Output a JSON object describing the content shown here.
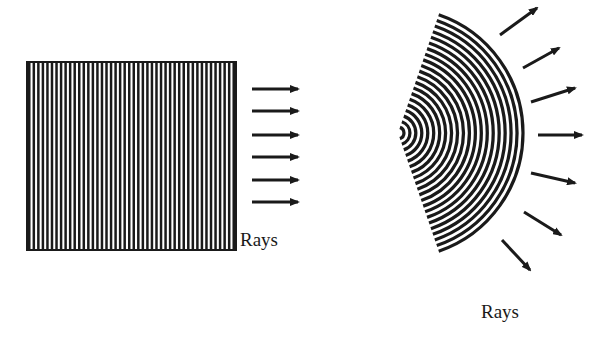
{
  "diagram": {
    "ink_color": "#1a1a1a",
    "background": "#ffffff",
    "plane_wave": {
      "label": "Rays",
      "box": {
        "x": 27,
        "y": 62,
        "width": 209,
        "height": 188
      },
      "stripe_count": 46,
      "arrows": [
        {
          "x1": 252,
          "y1": 89,
          "x2": 298,
          "y2": 89
        },
        {
          "x1": 252,
          "y1": 111,
          "x2": 298,
          "y2": 111
        },
        {
          "x1": 252,
          "y1": 135,
          "x2": 298,
          "y2": 135
        },
        {
          "x1": 252,
          "y1": 157,
          "x2": 298,
          "y2": 157
        },
        {
          "x1": 252,
          "y1": 180,
          "x2": 298,
          "y2": 180
        },
        {
          "x1": 252,
          "y1": 202,
          "x2": 298,
          "y2": 202
        }
      ]
    },
    "spherical_wave": {
      "label": "Rays",
      "vertex": {
        "x": 398,
        "y": 133
      },
      "outer_radius": 125,
      "half_angle_deg": 71,
      "ring_count": 21,
      "arrows": [
        {
          "x1": 500,
          "y1": 35,
          "x2": 537,
          "y2": 8
        },
        {
          "x1": 523,
          "y1": 68,
          "x2": 559,
          "y2": 48
        },
        {
          "x1": 531,
          "y1": 102,
          "x2": 575,
          "y2": 88
        },
        {
          "x1": 538,
          "y1": 135,
          "x2": 582,
          "y2": 135
        },
        {
          "x1": 531,
          "y1": 173,
          "x2": 575,
          "y2": 183
        },
        {
          "x1": 524,
          "y1": 212,
          "x2": 561,
          "y2": 235
        },
        {
          "x1": 502,
          "y1": 240,
          "x2": 530,
          "y2": 270
        }
      ]
    }
  }
}
